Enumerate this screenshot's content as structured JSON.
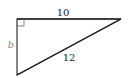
{
  "diagram": {
    "type": "right-triangle",
    "labels": {
      "top_side": "10",
      "left_side": "b",
      "hypotenuse": "12"
    },
    "right_angle_marker": true,
    "colors": {
      "stroke": "#333333",
      "label": "#222222",
      "variable_label": "#888888"
    }
  }
}
